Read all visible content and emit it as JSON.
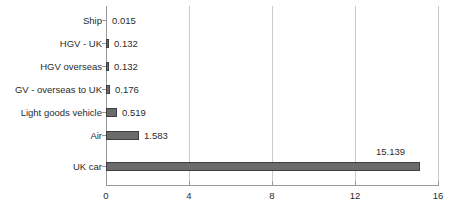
{
  "chart_data": {
    "type": "bar",
    "orientation": "horizontal",
    "title": "",
    "subtitle": "",
    "xlabel": "",
    "ylabel": "",
    "xlim": [
      0,
      16
    ],
    "xticks": [
      "0",
      "4",
      "8",
      "12",
      "16"
    ],
    "xtick_values": [
      0,
      4,
      8,
      12,
      16
    ],
    "grid": "vertical",
    "legend": "none",
    "value_label_format": "3 decimal places",
    "categories": [
      "Ship",
      "HGV - UK",
      "HGV overseas",
      "GV - overseas to UK",
      "Light goods vehicle",
      "Air",
      "UK car"
    ],
    "values": [
      0.015,
      0.132,
      0.132,
      0.176,
      0.519,
      1.583,
      15.139
    ],
    "value_labels": [
      "0.015",
      "0.132",
      "0.132",
      "0.176",
      "0.519",
      "1.583",
      "15.139"
    ],
    "label_placement": [
      "right",
      "right",
      "right",
      "right",
      "right",
      "right",
      "above-right"
    ],
    "series": [
      {
        "name": "",
        "values": [
          0.015,
          0.132,
          0.132,
          0.176,
          0.519,
          1.583,
          15.139
        ]
      }
    ],
    "colors": {
      "bar_fill": "#6b6b6b",
      "bar_border": "#3f3f3f",
      "gridline": "#c9c9c9",
      "axis": "#9a9a9a",
      "text": "#2b2b2b",
      "background": "#ffffff"
    }
  }
}
